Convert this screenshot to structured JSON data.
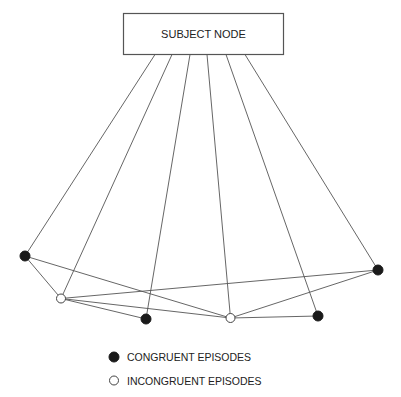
{
  "subject_node": {
    "label": "SUBJECT NODE"
  },
  "legend": {
    "congruent": {
      "label": "CONGRUENT EPISODES",
      "color": "#1a1a1a"
    },
    "incongruent": {
      "label": "INCONGRUENT EPISODES",
      "color": "#ffffff"
    }
  },
  "episodes": [
    {
      "id": "c1",
      "type": "congruent"
    },
    {
      "id": "i1",
      "type": "incongruent"
    },
    {
      "id": "c2",
      "type": "congruent"
    },
    {
      "id": "i2",
      "type": "incongruent"
    },
    {
      "id": "c3",
      "type": "congruent"
    },
    {
      "id": "c4",
      "type": "congruent"
    }
  ],
  "subject_links": [
    "c1",
    "i1",
    "c2",
    "i2",
    "c3",
    "c4"
  ],
  "episode_links": [
    [
      "c1",
      "i1"
    ],
    [
      "c1",
      "i2"
    ],
    [
      "i1",
      "c4"
    ],
    [
      "i1",
      "i2"
    ],
    [
      "i1",
      "c2"
    ],
    [
      "i2",
      "c4"
    ],
    [
      "i2",
      "c3"
    ]
  ]
}
